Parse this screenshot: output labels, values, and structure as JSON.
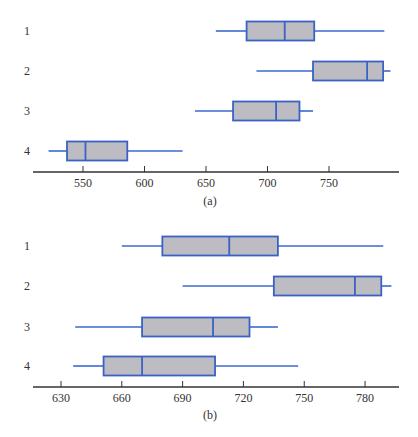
{
  "colors": {
    "box_fill": "#bcbcc2",
    "box_stroke": "#3a62c4",
    "whisker": "#3a6ad0",
    "axis": "#333333",
    "text": "#333333"
  },
  "chart_data": [
    {
      "type": "boxplot",
      "orientation": "horizontal",
      "panel_label": "(a)",
      "title": "",
      "xlabel": "",
      "ylabel": "",
      "grid": false,
      "xlim": [
        510,
        800
      ],
      "xticks": [
        550,
        600,
        650,
        700,
        750
      ],
      "categories": [
        "1",
        "2",
        "3",
        "4"
      ],
      "series": [
        {
          "name": "1",
          "whisker_low": 658,
          "q1": 683,
          "median": 714,
          "q3": 738,
          "whisker_high": 795
        },
        {
          "name": "2",
          "whisker_low": 691,
          "q1": 737,
          "median": 781,
          "q3": 794,
          "whisker_high": 800
        },
        {
          "name": "3",
          "whisker_low": 641,
          "q1": 672,
          "median": 707,
          "q3": 726,
          "whisker_high": 737
        },
        {
          "name": "4",
          "whisker_low": 522,
          "q1": 537,
          "median": 552,
          "q3": 586,
          "whisker_high": 631
        }
      ]
    },
    {
      "type": "boxplot",
      "orientation": "horizontal",
      "panel_label": "(b)",
      "title": "",
      "xlabel": "",
      "ylabel": "",
      "grid": false,
      "xlim": [
        615,
        795
      ],
      "xticks": [
        630,
        660,
        690,
        720,
        750,
        780
      ],
      "categories": [
        "1",
        "2",
        "3",
        "4"
      ],
      "series": [
        {
          "name": "1",
          "whisker_low": 660,
          "q1": 680,
          "median": 713,
          "q3": 737,
          "whisker_high": 789
        },
        {
          "name": "2",
          "whisker_low": 690,
          "q1": 735,
          "median": 775,
          "q3": 788,
          "whisker_high": 793
        },
        {
          "name": "3",
          "whisker_low": 637,
          "q1": 670,
          "median": 705,
          "q3": 723,
          "whisker_high": 737
        },
        {
          "name": "4",
          "whisker_low": 636,
          "q1": 651,
          "median": 670,
          "q3": 706,
          "whisker_high": 747
        }
      ]
    }
  ],
  "layout": {
    "panels": [
      {
        "x_ref": [
          550,
          83
        ],
        "px_per_unit": 1.23,
        "axis_y": 172,
        "axis_x0": 33,
        "axis_x1": 399,
        "row_y": [
          31,
          71,
          111,
          151
        ],
        "box_half": 9.5,
        "label_x": 27,
        "tick_label_y": 187,
        "panel_label_y": 205,
        "panel_label_x": 210
      },
      {
        "x_ref": [
          630,
          61
        ],
        "px_per_unit": 2.027,
        "axis_y": 387,
        "axis_x0": 33,
        "axis_x1": 399,
        "row_y": [
          246,
          286,
          327,
          366
        ],
        "box_half": 9.5,
        "label_x": 27,
        "tick_label_y": 402,
        "panel_label_y": 419,
        "panel_label_x": 210
      }
    ]
  }
}
